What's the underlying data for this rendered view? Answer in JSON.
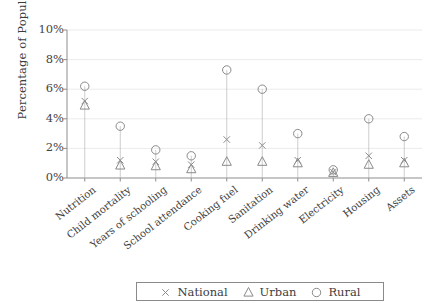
{
  "chart_data": {
    "type": "scatter",
    "title": "",
    "xlabel": "",
    "ylabel": "Percentage of Population",
    "ylim": [
      0,
      10
    ],
    "ytick_labels": [
      "0%",
      "2%",
      "4%",
      "6%",
      "8%",
      "10%"
    ],
    "ytick_values": [
      0,
      2,
      4,
      6,
      8,
      10
    ],
    "grid": true,
    "grid_axis": "y",
    "legend_position": "bottom-center",
    "categories": [
      "Nutrition",
      "Child mortality",
      "Years of schooling",
      "School attendance",
      "Cooking fuel",
      "Sanitation",
      "Drinking water",
      "Electricity",
      "Housing",
      "Assets"
    ],
    "series": [
      {
        "name": "National",
        "marker": "x",
        "color": "#8a8a8a",
        "values": [
          5.2,
          1.2,
          1.1,
          0.9,
          2.6,
          2.2,
          1.2,
          0.4,
          1.5,
          1.2
        ]
      },
      {
        "name": "Urban",
        "marker": "triangle",
        "color": "#8a8a8a",
        "values": [
          4.9,
          0.85,
          0.8,
          0.6,
          1.1,
          1.1,
          1.0,
          0.35,
          0.9,
          1.0
        ]
      },
      {
        "name": "Rural",
        "marker": "circle",
        "color": "#8a8a8a",
        "values": [
          6.2,
          3.5,
          1.9,
          1.5,
          7.3,
          6.0,
          3.0,
          0.55,
          4.0,
          2.8
        ]
      }
    ]
  },
  "legend": {
    "entries": [
      {
        "label": "National",
        "marker": "x"
      },
      {
        "label": "Urban",
        "marker": "triangle"
      },
      {
        "label": "Rural",
        "marker": "circle"
      }
    ]
  },
  "axis": {
    "y_title": "Percentage of Population"
  }
}
